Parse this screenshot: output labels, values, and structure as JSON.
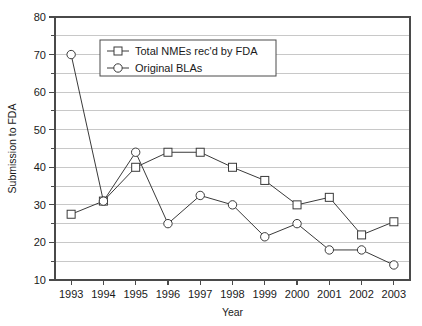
{
  "chart_data": {
    "type": "line",
    "title": "",
    "xlabel": "Year",
    "ylabel": "Submission to FDA",
    "categories": [
      1993,
      1994,
      1995,
      1996,
      1997,
      1998,
      1999,
      2000,
      2001,
      2002,
      2003
    ],
    "x": [
      "1993",
      "1994",
      "1995",
      "1996",
      "1997",
      "1998",
      "1999",
      "2000",
      "2001",
      "2002",
      "2003"
    ],
    "xlim": [
      1992.5,
      2003.5
    ],
    "ylim": [
      10,
      80
    ],
    "yticks": [
      10,
      20,
      30,
      40,
      50,
      60,
      70,
      80
    ],
    "yticks_minor": [
      15,
      25,
      35,
      45,
      55,
      65,
      75
    ],
    "grid": true,
    "grid_interval": 5,
    "legend_position": "top-center",
    "series": [
      {
        "name": "Total NMEs rec'd by FDA",
        "marker": "square",
        "values": [
          27.5,
          31,
          40,
          44,
          44,
          40,
          36.5,
          30,
          32,
          22,
          25.5
        ]
      },
      {
        "name": "Original BLAs",
        "marker": "circle",
        "values": [
          70,
          31,
          44,
          25,
          32.5,
          30,
          21.5,
          25,
          18,
          18,
          14
        ]
      }
    ]
  },
  "axes": {
    "y_tick_labels": [
      "80",
      "70",
      "60",
      "50",
      "40",
      "30",
      "20",
      "10"
    ],
    "x_tick_labels": [
      "1993",
      "1994",
      "1995",
      "1996",
      "1997",
      "1998",
      "1999",
      "2000",
      "2001",
      "2002",
      "2003"
    ],
    "y_axis_title": "Submission to FDA",
    "x_axis_title": "Year"
  },
  "legend": {
    "entries": [
      {
        "label": "Total NMEs rec'd by FDA",
        "marker": "square"
      },
      {
        "label": "Original BLAs",
        "marker": "circle"
      }
    ]
  },
  "colors": {
    "background": "#ffffff",
    "grid": "#c8c8c8",
    "frame": "#4a4a4a",
    "series_line": "#3a3a3a",
    "marker_fill": "#ffffff",
    "text": "#1a1a1a"
  }
}
